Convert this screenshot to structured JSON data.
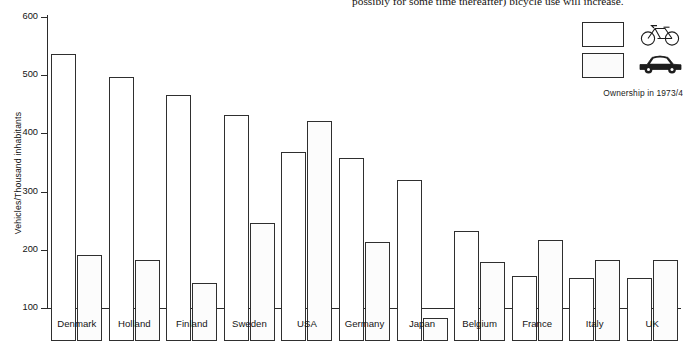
{
  "page": {
    "body_copy_fragment": "possibly for some time thereafter) bicycle use will increase."
  },
  "legend": {
    "caption": "Ownership in 1973/4",
    "entries": [
      {
        "key": "bicycles",
        "swatch": "hollow-white-box",
        "glyph": "bicycle-icon",
        "label": "Bicycles"
      },
      {
        "key": "cars",
        "swatch": "dotted-box",
        "glyph": "car-icon",
        "label": "Cars"
      }
    ]
  },
  "chart_data": {
    "type": "bar",
    "title": "",
    "xlabel": "",
    "ylabel": "Vehicles/Thousand inhabitants",
    "ylim": [
      100,
      600
    ],
    "yticks": [
      100,
      200,
      300,
      400,
      500,
      600
    ],
    "grid": false,
    "legend_position": "top-right",
    "categories": [
      "Denmark",
      "Holland",
      "Finland",
      "Sweden",
      "USA",
      "Germany",
      "Japan",
      "Belgium",
      "France",
      "Italy",
      "UK"
    ],
    "series": [
      {
        "name": "Bicycles",
        "style": "hollow",
        "values": [
          593,
          553,
          522,
          488,
          425,
          415,
          376,
          289,
          212,
          208,
          208
        ]
      },
      {
        "name": "Cars",
        "style": "dotted",
        "values": [
          247,
          240,
          200,
          303,
          478,
          270,
          139,
          235,
          273,
          239,
          239
        ]
      }
    ]
  }
}
